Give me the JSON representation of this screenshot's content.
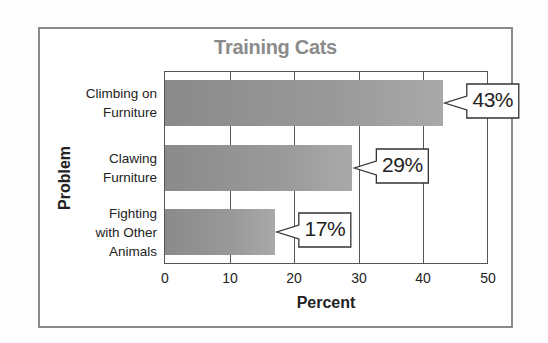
{
  "chart_data": {
    "type": "bar",
    "orientation": "horizontal",
    "title": "Training Cats",
    "xlabel": "Percent",
    "ylabel": "Problem",
    "categories": [
      "Climbing on Furniture",
      "Clawing Furniture",
      "Fighting with Other Animals"
    ],
    "category_lines": [
      "Climbing on\nFurniture",
      "Clawing\nFurniture",
      "Fighting\nwith Other\nAnimals"
    ],
    "values": [
      43,
      29,
      17
    ],
    "value_labels": [
      "43%",
      "29%",
      "17%"
    ],
    "xlim": [
      0,
      50
    ],
    "xticks": [
      0,
      10,
      20,
      30,
      40,
      50
    ],
    "xtick_labels": [
      "0",
      "10",
      "20",
      "30",
      "40",
      "50"
    ],
    "grid": "vertical",
    "legend": "none",
    "bar_color": "#999999",
    "title_color": "#8b8b8b"
  }
}
